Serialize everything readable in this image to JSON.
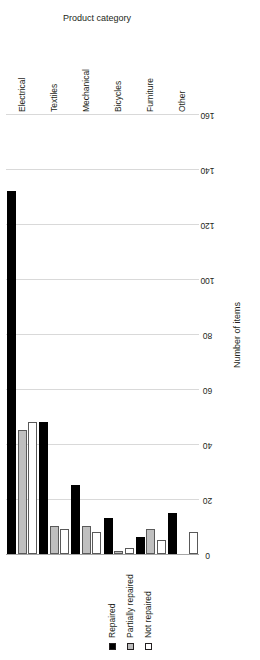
{
  "chart_data": {
    "type": "bar",
    "orientation": "horizontal",
    "title": "",
    "xlabel": "Number of items",
    "ylabel": "Product category",
    "categories": [
      "Electrical",
      "Textiles",
      "Mechanical",
      "Bicycles",
      "Furniture",
      "Other"
    ],
    "series": [
      {
        "name": "Repaired",
        "color": "#000000",
        "values": [
          132,
          48,
          25,
          13,
          6,
          15
        ]
      },
      {
        "name": "Partially repaired",
        "color": "#bfbfbf",
        "values": [
          45,
          10,
          10,
          1,
          9,
          0
        ]
      },
      {
        "name": "Not repaired",
        "color": "#ffffff",
        "values": [
          48,
          9,
          8,
          2,
          5,
          8
        ]
      }
    ],
    "xlim": [
      0,
      160
    ],
    "xticks": [
      0,
      20,
      40,
      60,
      80,
      100,
      120,
      140,
      160
    ],
    "grid": true,
    "legend_position": "top-left"
  },
  "legend": {
    "items": [
      {
        "label": "Repaired",
        "swatch": "black-square-icon"
      },
      {
        "label": "Partially repaired",
        "swatch": "gray-square-icon"
      },
      {
        "label": "Not repaired",
        "swatch": "white-square-icon"
      }
    ]
  },
  "axes": {
    "value_axis_label": "Number of items",
    "category_axis_label": "Product category",
    "tick_labels": [
      "0",
      "20",
      "40",
      "60",
      "80",
      "100",
      "120",
      "140",
      "160"
    ]
  }
}
